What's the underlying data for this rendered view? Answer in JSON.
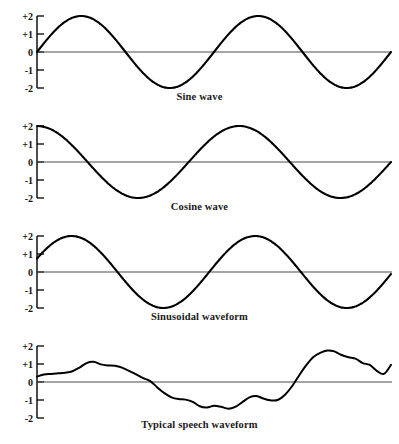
{
  "figure": {
    "background_color": "#ffffff",
    "line_color": "#000000",
    "axis_color": "#000000",
    "zero_line_color": "#4d4d4d"
  },
  "axis": {
    "tick_labels": [
      "+2",
      "+1",
      "0",
      "-1",
      "-2"
    ],
    "tick_values": [
      2,
      1,
      0,
      -1,
      -2
    ],
    "ylim": [
      -2,
      2
    ],
    "xlim": [
      0,
      1
    ],
    "grid": false
  },
  "panels": [
    {
      "id": "sine",
      "caption": "Sine wave",
      "tick_labels": [
        "+2",
        "+1",
        "0",
        "-1",
        "-2"
      ]
    },
    {
      "id": "cosine",
      "caption": "Cosine wave",
      "tick_labels": [
        "+2",
        "+1",
        "0",
        "-1",
        "-2"
      ]
    },
    {
      "id": "sinusoidal",
      "caption": "Sinusoidal waveform",
      "tick_labels": [
        "+2",
        "+1",
        "0",
        "-1",
        "-2"
      ]
    },
    {
      "id": "speech",
      "caption": "Typical speech waveform",
      "tick_labels": [
        "+2",
        "+1",
        "0",
        "-1",
        "-2"
      ]
    }
  ],
  "chart_data": [
    {
      "type": "line",
      "title": "Sine wave",
      "xlabel": "",
      "ylabel": "",
      "ylim": [
        -2,
        2
      ],
      "xlim": [
        0,
        2
      ],
      "yticks": [
        2,
        1,
        0,
        -1,
        -2
      ],
      "ytick_labels": [
        "+2",
        "+1",
        "0",
        "-1",
        "-2"
      ],
      "grid": false,
      "legend": "none",
      "description": "Two full cycles of a sine wave with amplitude 2, starting at 0 rising to +2, down to -2, back through 0, up to +2, ending at 0.",
      "series": [
        {
          "name": "sine",
          "formula": "y = 2*sin(2*pi*x)",
          "amplitude": 2,
          "cycles": 2,
          "phase_deg": 0,
          "x": [
            0,
            0.125,
            0.25,
            0.375,
            0.5,
            0.625,
            0.75,
            0.875,
            1.0,
            1.125,
            1.25,
            1.375,
            1.5,
            1.625,
            1.75,
            1.875,
            2.0
          ],
          "values": [
            0,
            1.41,
            2,
            1.41,
            0,
            -1.41,
            -2,
            -1.41,
            0,
            1.41,
            2,
            1.41,
            0,
            -1.41,
            -2,
            -1.41,
            0
          ]
        }
      ]
    },
    {
      "type": "line",
      "title": "Cosine wave",
      "xlabel": "",
      "ylabel": "",
      "ylim": [
        -2,
        2
      ],
      "xlim": [
        0,
        2
      ],
      "yticks": [
        2,
        1,
        0,
        -1,
        -2
      ],
      "ytick_labels": [
        "+2",
        "+1",
        "0",
        "-1",
        "-2"
      ],
      "grid": false,
      "legend": "none",
      "description": "Cosine wave amplitude 2 starting at +2, falling to -2, rising to +2, ending at -2 at the right edge.",
      "series": [
        {
          "name": "cosine",
          "formula": "y = 2*cos(2*pi*x)",
          "amplitude": 2,
          "cycles": 2,
          "phase_deg": 90,
          "x": [
            0,
            0.125,
            0.25,
            0.375,
            0.5,
            0.625,
            0.75,
            0.875,
            1.0,
            1.125,
            1.25,
            1.375,
            1.5,
            1.625,
            1.75,
            1.875,
            2.0
          ],
          "values": [
            2,
            1.41,
            0,
            -1.41,
            -2,
            -1.41,
            0,
            1.41,
            2,
            1.41,
            0,
            -1.41,
            -2,
            -1.41,
            0,
            1.41,
            2
          ]
        }
      ]
    },
    {
      "type": "line",
      "title": "Sinusoidal waveform",
      "xlabel": "",
      "ylabel": "",
      "ylim": [
        -2,
        2
      ],
      "xlim": [
        0,
        2
      ],
      "yticks": [
        2,
        1,
        0,
        -1,
        -2
      ],
      "ytick_labels": [
        "+2",
        "+1",
        "0",
        "-1",
        "-2"
      ],
      "grid": false,
      "legend": "none",
      "description": "Phase-shifted sine of amplitude 2 beginning near +0.75, peaking at +2, dipping to -2, rising to +2, and ending near -0.65.",
      "series": [
        {
          "name": "sinusoid",
          "formula": "y = 2*sin(2*pi*x + 22deg)",
          "amplitude": 2,
          "cycles": 2,
          "phase_deg": 22,
          "x": [
            0,
            0.125,
            0.25,
            0.375,
            0.5,
            0.625,
            0.75,
            0.875,
            1.0,
            1.125,
            1.25,
            1.375,
            1.5,
            1.625,
            1.75,
            1.875,
            2.0
          ],
          "values": [
            0.75,
            1.85,
            1.94,
            1.0,
            -0.38,
            -1.58,
            -2.0,
            -1.3,
            0.0,
            1.2,
            1.98,
            1.72,
            0.62,
            -0.75,
            -1.8,
            -1.95,
            -0.65
          ]
        }
      ]
    },
    {
      "type": "line",
      "title": "Typical speech waveform",
      "xlabel": "",
      "ylabel": "",
      "ylim": [
        -2,
        2
      ],
      "xlim": [
        0,
        1
      ],
      "yticks": [
        2,
        1,
        0,
        -1,
        -2
      ],
      "ytick_labels": [
        "+2",
        "+1",
        "0",
        "-1",
        "-2"
      ],
      "grid": false,
      "legend": "none",
      "description": "Irregular speech-like waveform starting near +0.3, small hump to +1.1, falling below zero to about -1.5, recovering through zero to a peak of about +1.75, then settling between +0.4 and +1.0.",
      "series": [
        {
          "name": "speech",
          "x": [
            0.0,
            0.02,
            0.04,
            0.06,
            0.08,
            0.1,
            0.12,
            0.14,
            0.16,
            0.18,
            0.2,
            0.22,
            0.24,
            0.26,
            0.28,
            0.3,
            0.32,
            0.34,
            0.36,
            0.38,
            0.4,
            0.42,
            0.44,
            0.46,
            0.48,
            0.5,
            0.52,
            0.54,
            0.56,
            0.58,
            0.6,
            0.62,
            0.64,
            0.66,
            0.68,
            0.7,
            0.72,
            0.74,
            0.76,
            0.78,
            0.8,
            0.82,
            0.84,
            0.86,
            0.88,
            0.9,
            0.92,
            0.94,
            0.96,
            0.98,
            1.0
          ],
          "values": [
            0.3,
            0.42,
            0.45,
            0.48,
            0.52,
            0.6,
            0.8,
            1.05,
            1.12,
            0.98,
            0.92,
            0.9,
            0.8,
            0.62,
            0.42,
            0.22,
            0.05,
            -0.3,
            -0.62,
            -0.85,
            -0.95,
            -0.98,
            -1.1,
            -1.35,
            -1.42,
            -1.32,
            -1.38,
            -1.48,
            -1.38,
            -1.12,
            -0.85,
            -0.78,
            -0.92,
            -1.02,
            -1.0,
            -0.72,
            -0.25,
            0.35,
            0.92,
            1.38,
            1.62,
            1.75,
            1.7,
            1.5,
            1.38,
            1.3,
            1.05,
            0.95,
            0.62,
            0.45,
            0.95
          ]
        }
      ]
    }
  ]
}
